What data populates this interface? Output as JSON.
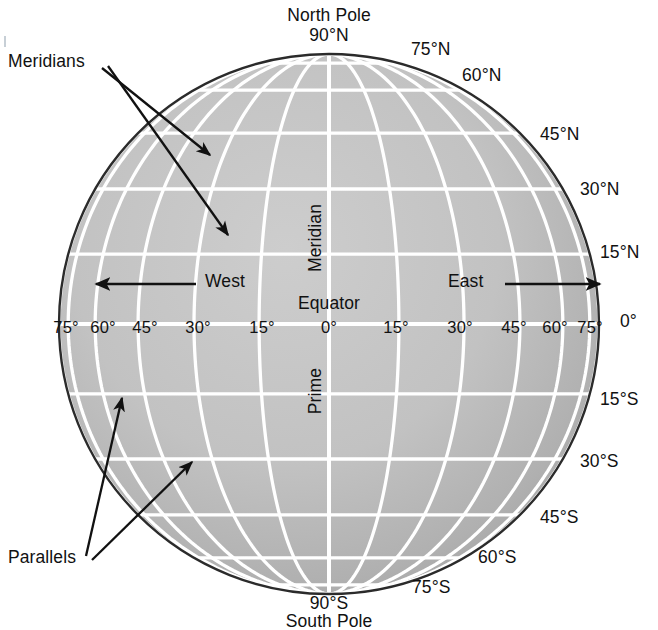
{
  "figure": {
    "kind": "globe-graticule-diagram",
    "projection": "orthographic",
    "grid_interval_degrees": 15,
    "colors": {
      "background": "#ffffff",
      "globe_fill_light": "#c8c8c8",
      "globe_fill_dark": "#a6a6a6",
      "graticule": "#ffffff",
      "outline": "#2b2b2b",
      "text": "#111111"
    }
  },
  "poles": {
    "north_name": "North Pole",
    "north_value": "90°N",
    "south_value": "90°S",
    "south_name": "South Pole"
  },
  "center_labels": {
    "meridian_upper": "Meridian",
    "equator": "Equator",
    "equator_value": "0°",
    "prime_lower": "Prime"
  },
  "direction_labels": {
    "west": "West",
    "east": "East"
  },
  "callouts": [
    {
      "label": "Meridians",
      "arrows": 2
    },
    {
      "label": "Parallels",
      "arrows": 2
    }
  ],
  "latitude_labels_right": [
    {
      "text": "75°N",
      "value": 75
    },
    {
      "text": "60°N",
      "value": 60
    },
    {
      "text": "45°N",
      "value": 45
    },
    {
      "text": "30°N",
      "value": 30
    },
    {
      "text": "15°N",
      "value": 15
    },
    {
      "text": "0°",
      "value": 0
    },
    {
      "text": "15°S",
      "value": -15
    },
    {
      "text": "30°S",
      "value": -30
    },
    {
      "text": "45°S",
      "value": -45
    },
    {
      "text": "60°S",
      "value": -60
    },
    {
      "text": "75°S",
      "value": -75
    }
  ],
  "longitude_labels_equator": [
    {
      "text": "75°",
      "value": -75
    },
    {
      "text": "60°",
      "value": -60
    },
    {
      "text": "45°",
      "value": -45
    },
    {
      "text": "30°",
      "value": -30
    },
    {
      "text": "15°",
      "value": -15
    },
    {
      "text": "0°",
      "value": 0
    },
    {
      "text": "15°",
      "value": 15
    },
    {
      "text": "30°",
      "value": 30
    },
    {
      "text": "45°",
      "value": 45
    },
    {
      "text": "60°",
      "value": 60
    },
    {
      "text": "75°",
      "value": 75
    },
    {
      "text": "0°",
      "value": 90
    }
  ]
}
